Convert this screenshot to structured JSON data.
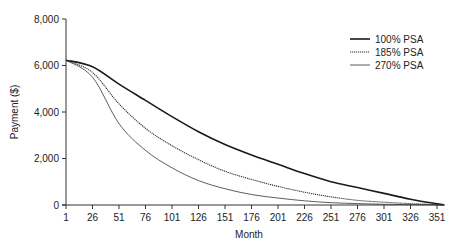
{
  "chart_data": {
    "type": "line",
    "title": "",
    "xlabel": "Month",
    "ylabel": "Payment ($)",
    "xlim": [
      1,
      360
    ],
    "ylim": [
      0,
      8000
    ],
    "x_ticks": [
      1,
      26,
      51,
      76,
      101,
      126,
      151,
      176,
      201,
      226,
      251,
      276,
      301,
      326,
      351
    ],
    "y_ticks": [
      0,
      2000,
      4000,
      6000,
      8000
    ],
    "y_tick_labels": [
      "0",
      "2,000",
      "4,000",
      "6,000",
      "8,000"
    ],
    "grid": false,
    "legend_position": "upper right",
    "x": [
      1,
      26,
      51,
      76,
      101,
      126,
      151,
      176,
      201,
      226,
      251,
      276,
      301,
      326,
      351,
      358
    ],
    "series": [
      {
        "name": "100% PSA",
        "style": "solid-thick",
        "color": "#1a1a1a",
        "values": [
          6230,
          5950,
          5200,
          4500,
          3800,
          3150,
          2600,
          2150,
          1750,
          1350,
          1000,
          750,
          500,
          250,
          50,
          0
        ]
      },
      {
        "name": "185% PSA",
        "style": "dotted",
        "color": "#333333",
        "values": [
          6230,
          5700,
          4350,
          3300,
          2550,
          1950,
          1450,
          1100,
          800,
          550,
          350,
          200,
          120,
          60,
          20,
          0
        ]
      },
      {
        "name": "270% PSA",
        "style": "solid-thin",
        "color": "#333333",
        "values": [
          6230,
          5500,
          3500,
          2350,
          1600,
          1050,
          700,
          450,
          300,
          180,
          100,
          60,
          30,
          15,
          5,
          0
        ]
      }
    ]
  }
}
